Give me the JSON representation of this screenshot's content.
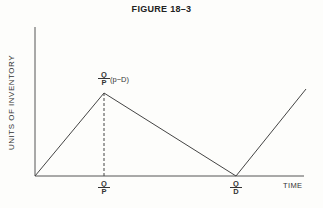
{
  "figure": {
    "title": "FIGURE 18–3",
    "y_axis_label": "UNITS OF INVENTORY",
    "x_axis_label": "TIME",
    "peak_label": {
      "numerator": "Q",
      "denominator": "P",
      "suffix": "(p−D)"
    },
    "x_tick_labels": [
      {
        "numerator": "Q",
        "denominator": "P"
      },
      {
        "numerator": "Q",
        "denominator": "D"
      }
    ],
    "colors": {
      "line": "#444444",
      "background": "#fdfdfb"
    }
  }
}
